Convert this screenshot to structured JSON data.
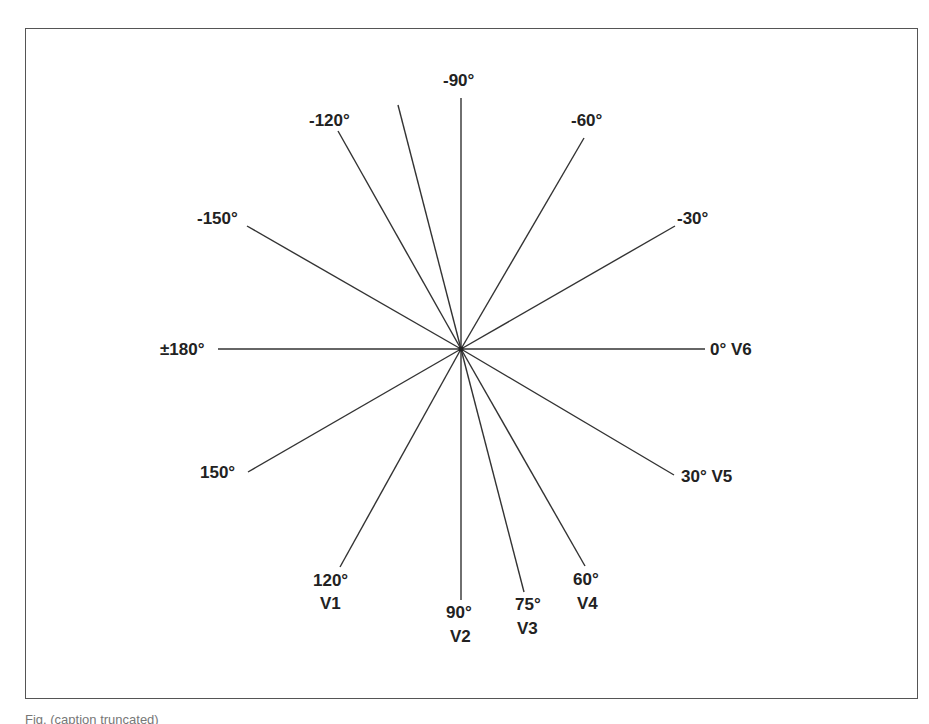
{
  "diagram": {
    "center": {
      "x": 461,
      "y": 349
    },
    "axes": [
      {
        "angle": 0,
        "label": "0° V6",
        "lead": "V6"
      },
      {
        "angle": -30,
        "label": "-30°"
      },
      {
        "angle": -60,
        "label": "-60°"
      },
      {
        "angle": -90,
        "label": "-90°"
      },
      {
        "angle": -105,
        "label": ""
      },
      {
        "angle": -120,
        "label": "-120°"
      },
      {
        "angle": -150,
        "label": "-150°"
      },
      {
        "angle": 180,
        "label": "±180°"
      },
      {
        "angle": 150,
        "label": "150°"
      },
      {
        "angle": 120,
        "label": "120°",
        "lead": "V1"
      },
      {
        "angle": 90,
        "label": "90°",
        "lead": "V2"
      },
      {
        "angle": 75,
        "label": "75°",
        "lead": "V3"
      },
      {
        "angle": 60,
        "label": "60°",
        "lead": "V4"
      },
      {
        "angle": 30,
        "label": "30° V5",
        "lead": "V5"
      }
    ],
    "labels": {
      "l0": "0° V6",
      "lm30": "-30°",
      "lm60": "-60°",
      "lm90": "-90°",
      "lm120": "-120°",
      "lm150": "-150°",
      "l180": "±180°",
      "l150": "150°",
      "l120": "120°",
      "v1": "V1",
      "l90": "90°",
      "v2": "V2",
      "l75": "75°",
      "v3": "V3",
      "l60": "60°",
      "v4": "V4",
      "l30": "30° V5"
    }
  },
  "caption": "Fig. (caption truncated)"
}
